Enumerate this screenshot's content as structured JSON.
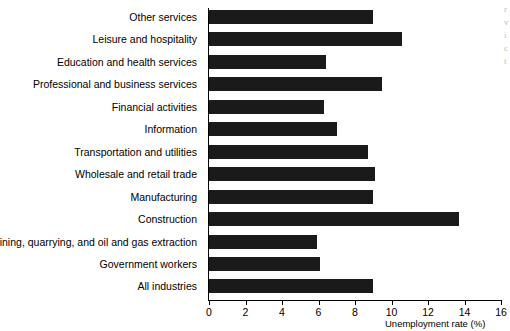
{
  "chart_data": {
    "type": "bar",
    "orientation": "horizontal",
    "title": "",
    "xlabel": "Unemployment rate (%)",
    "ylabel": "",
    "xlim": [
      0,
      16
    ],
    "xticks": [
      0,
      2,
      4,
      6,
      8,
      10,
      12,
      14,
      16
    ],
    "grid": false,
    "legend": null,
    "bar_color": "#1a1a1a",
    "categories": [
      "Other services",
      "Leisure and hospitality",
      "Education and health services",
      "Professional and business services",
      "Financial activities",
      "Information",
      "Transportation and utilities",
      "Wholesale and retail trade",
      "Manufacturing",
      "Construction",
      "Mining, quarrying, and oil and gas extraction",
      "Government workers",
      "All industries"
    ],
    "values": [
      9.0,
      10.6,
      6.4,
      9.5,
      6.3,
      7.0,
      8.7,
      9.1,
      9.0,
      13.7,
      5.9,
      6.1,
      9.0
    ]
  },
  "margin_fragments": [
    "r",
    "v",
    "i",
    "c",
    "t"
  ]
}
